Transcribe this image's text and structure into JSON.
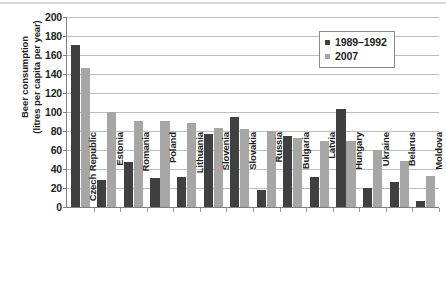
{
  "chart_data": {
    "type": "bar",
    "title": "",
    "xlabel": "",
    "ylabel": "Beer consumption (litres per capita per year)",
    "ylabel_line1": "Beer consumption",
    "ylabel_line2": "(litres per capita per year)",
    "ylim": [
      0,
      200
    ],
    "ytick_step": 20,
    "yticks": [
      200,
      180,
      160,
      140,
      120,
      100,
      80,
      60,
      40,
      20,
      0
    ],
    "grid": "horizontal",
    "legend_position": "top-right",
    "categories": [
      "Czech Republic",
      "Estonia",
      "Romania",
      "Poland",
      "Lithuania",
      "Slovenia",
      "Slovakia",
      "Russia",
      "Bulgaria",
      "Latvia",
      "Hungary",
      "Ukraine",
      "Belarus",
      "Moldova"
    ],
    "series": [
      {
        "name": "1989–1992",
        "color": "#404040",
        "values": [
          171,
          28,
          47,
          31,
          32,
          77,
          95,
          18,
          75,
          32,
          103,
          20,
          26,
          6
        ]
      },
      {
        "name": "2007",
        "color": "#a6a6a6",
        "values": [
          146,
          100,
          91,
          91,
          88,
          83,
          82,
          80,
          73,
          69,
          70,
          60,
          48,
          33
        ]
      }
    ]
  },
  "legend": {
    "items": [
      {
        "label": "1989–1992",
        "swatch": "s0"
      },
      {
        "label": "2007",
        "swatch": "s1"
      }
    ]
  }
}
